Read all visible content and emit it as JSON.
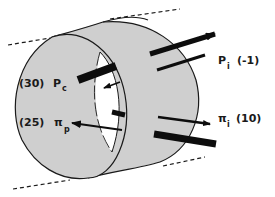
{
  "diagram": {
    "colors": {
      "wall_fill": "#cfcfcf",
      "outline": "#1a1a1a",
      "lumen": "#ffffff",
      "arrow": "#0d0d0d"
    },
    "labels": {
      "pc": {
        "value": "(30)",
        "symbol": "P",
        "subscript": "c"
      },
      "pi_p": {
        "value": "(25)",
        "symbol": "π",
        "subscript": "p"
      },
      "p_i": {
        "symbol": "P",
        "subscript": "i",
        "value": "(-1)"
      },
      "pi_i": {
        "symbol": "π",
        "subscript": "i",
        "value": "(10)"
      }
    }
  }
}
